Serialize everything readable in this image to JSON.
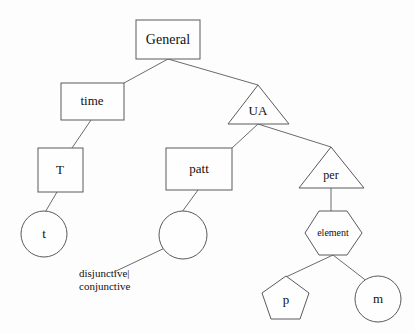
{
  "diagram": {
    "background_color": "#fdfdfd",
    "stroke_color": "#5a5a5a",
    "edge_color": "#6b6b6b",
    "text_color": "#111111",
    "nodes": {
      "general": {
        "label": "General",
        "shape": "rectangle",
        "font_size": "14"
      },
      "time": {
        "label": "time",
        "shape": "rectangle",
        "font_size": "13"
      },
      "ua": {
        "label": "UA",
        "shape": "triangle",
        "font_size": "13"
      },
      "t_upper": {
        "label": "T",
        "shape": "rectangle",
        "font_size": "13"
      },
      "patt": {
        "label": "patt",
        "shape": "rectangle",
        "font_size": "13"
      },
      "per": {
        "label": "per",
        "shape": "triangle",
        "font_size": "12"
      },
      "t_lower": {
        "label": "t",
        "shape": "circle",
        "font_size": "13"
      },
      "empty_circle": {
        "label": "",
        "shape": "circle",
        "font_size": "12"
      },
      "element": {
        "label": "element",
        "shape": "hexagon",
        "font_size": "10"
      },
      "p": {
        "label": "p",
        "shape": "pentagon",
        "font_size": "13"
      },
      "m": {
        "label": "m",
        "shape": "circle",
        "font_size": "13"
      }
    },
    "annotations": {
      "disjunctive_conjunctive": {
        "line1": "disjunctive|",
        "line2": "conjunctive",
        "font_size": "11"
      }
    }
  }
}
